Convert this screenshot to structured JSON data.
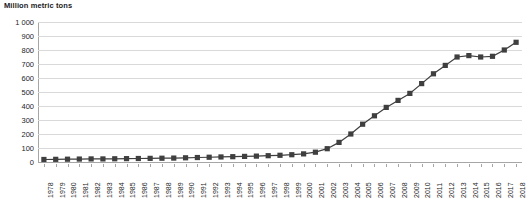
{
  "chart_data": {
    "type": "line",
    "title": "Million metric tons",
    "xlabel": "",
    "ylabel": "Million metric tons",
    "ylim": [
      0,
      1000
    ],
    "ytick_step": 100,
    "ytick_labels": [
      "1 000",
      "900",
      "800",
      "700",
      "600",
      "500",
      "400",
      "300",
      "200",
      "100",
      "0"
    ],
    "ytick_values": [
      1000,
      900,
      800,
      700,
      600,
      500,
      400,
      300,
      200,
      100,
      0
    ],
    "grid": true,
    "legend": "none",
    "marker": "square",
    "series_color": "#3f3f3f",
    "grid_color": "#d9d9d9",
    "axis_color": "#a6a6a6",
    "categories": [
      "1978",
      "1979",
      "1980",
      "1981",
      "1982",
      "1983",
      "1984",
      "1985",
      "1986",
      "1987",
      "1988",
      "1989",
      "1990",
      "1991",
      "1992",
      "1993",
      "1994",
      "1995",
      "1996",
      "1997",
      "1998",
      "1999",
      "2000",
      "2001",
      "2002",
      "2003",
      "2004",
      "2005",
      "2006",
      "2007",
      "2008",
      "2009",
      "2010",
      "2011",
      "2012",
      "2013",
      "2014",
      "2015",
      "2016",
      "2017",
      "2018"
    ],
    "values": [
      18,
      19,
      20,
      21,
      22,
      22,
      23,
      24,
      25,
      26,
      27,
      28,
      30,
      32,
      34,
      36,
      38,
      40,
      42,
      45,
      48,
      52,
      58,
      70,
      95,
      140,
      200,
      270,
      330,
      390,
      440,
      490,
      560,
      630,
      690,
      750,
      760,
      750,
      755,
      800,
      855
    ]
  }
}
